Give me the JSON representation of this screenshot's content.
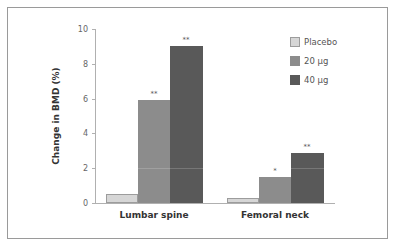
{
  "chart_data": {
    "type": "bar",
    "title": "",
    "xlabel": "",
    "ylabel": "Change in BMD (%)",
    "ylim": [
      0,
      10
    ],
    "yticks": [
      0,
      2,
      4,
      6,
      8,
      10
    ],
    "grid": false,
    "legend_position": "top-right",
    "categories": [
      "Lumbar spine",
      "Femoral neck"
    ],
    "series": [
      {
        "name": "Placebo",
        "color": "#d6d6d6",
        "values": [
          0.5,
          0.3
        ],
        "significance": [
          "",
          ""
        ]
      },
      {
        "name": "20 µg",
        "color": "#8c8c8c",
        "values": [
          5.9,
          1.5
        ],
        "significance": [
          "**",
          "*"
        ]
      },
      {
        "name": "40 µg",
        "color": "#595959",
        "values": [
          9.0,
          2.9
        ],
        "significance": [
          "**",
          "**"
        ]
      }
    ]
  },
  "labels": {
    "ylabel": "Change in BMD (%)",
    "ticks": [
      "0",
      "2",
      "4",
      "6",
      "8",
      "10"
    ],
    "categories": [
      "Lumbar spine",
      "Femoral neck"
    ],
    "legend": [
      "Placebo",
      "20 µg",
      "40 µg"
    ]
  }
}
